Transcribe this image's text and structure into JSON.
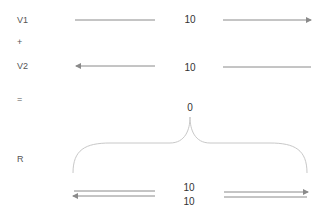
{
  "rows": {
    "v1": {
      "label": "V1",
      "value": "10"
    },
    "plus": {
      "label": "+"
    },
    "v2": {
      "label": "V2",
      "value": "10"
    },
    "equals": {
      "label": "="
    },
    "sum": {
      "value": "0"
    },
    "r": {
      "label": "R",
      "value_top": "10",
      "value_bottom": "10"
    }
  },
  "colors": {
    "line": "#8a8a8a",
    "brace": "#c8c8c8",
    "text": "#333333"
  }
}
